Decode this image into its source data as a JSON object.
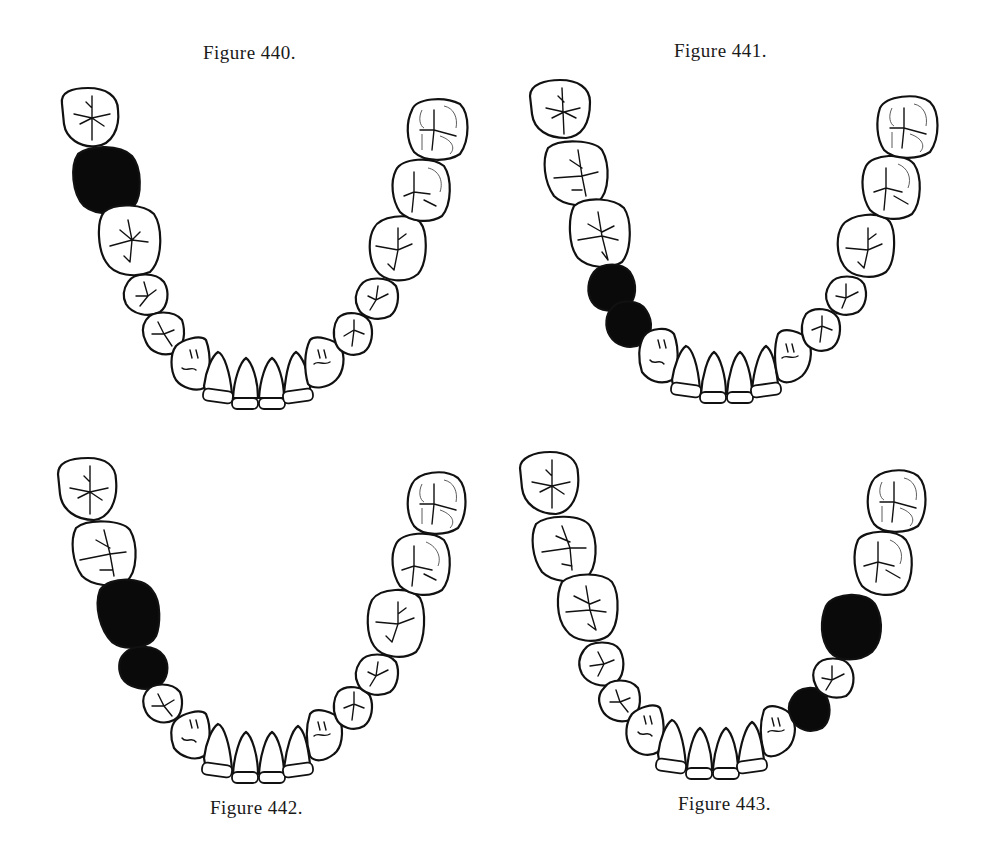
{
  "figures": [
    {
      "id": "fig440",
      "caption": "Figure 440.",
      "caption_position": "top",
      "missing_teeth": [
        "left-second-molar"
      ],
      "description": "Lower dental arch with left second molar missing (shown black)"
    },
    {
      "id": "fig441",
      "caption": "Figure 441.",
      "caption_position": "top",
      "missing_teeth": [
        "left-second-premolar",
        "left-first-premolar"
      ],
      "description": "Lower dental arch with both left premolars missing (shown black)"
    },
    {
      "id": "fig442",
      "caption": "Figure 442.",
      "caption_position": "bottom",
      "missing_teeth": [
        "left-first-molar",
        "left-second-premolar"
      ],
      "description": "Lower dental arch with left first molar and second premolar missing (shown black)"
    },
    {
      "id": "fig443",
      "caption": "Figure 443.",
      "caption_position": "bottom",
      "missing_teeth": [
        "right-first-molar",
        "right-first-premolar"
      ],
      "description": "Lower dental arch with right first molar and first premolar missing (shown black)"
    }
  ],
  "colors": {
    "outline": "#111111",
    "missing": "#0a0a0a",
    "background": "#ffffff"
  }
}
